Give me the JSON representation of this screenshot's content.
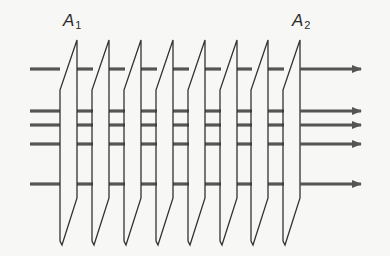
{
  "labels": {
    "a1": {
      "main": "A",
      "sub": "1"
    },
    "a2": {
      "main": "A",
      "sub": "2"
    }
  },
  "colors": {
    "background": "#f7f7f5",
    "plane_stroke": "#333333",
    "ray_stroke": "#555555"
  },
  "planes": {
    "count": 8,
    "right_edges_x": [
      77,
      109,
      141,
      173,
      205,
      237,
      268,
      300
    ],
    "left_offset": 17,
    "top_y": 40,
    "left_top_y": 90,
    "right_bottom_y": 198,
    "bottom_y": 245
  },
  "rays": {
    "y": [
      69,
      111,
      125,
      144,
      184
    ],
    "start_x": 30,
    "end_x": 361,
    "arrow": true
  }
}
